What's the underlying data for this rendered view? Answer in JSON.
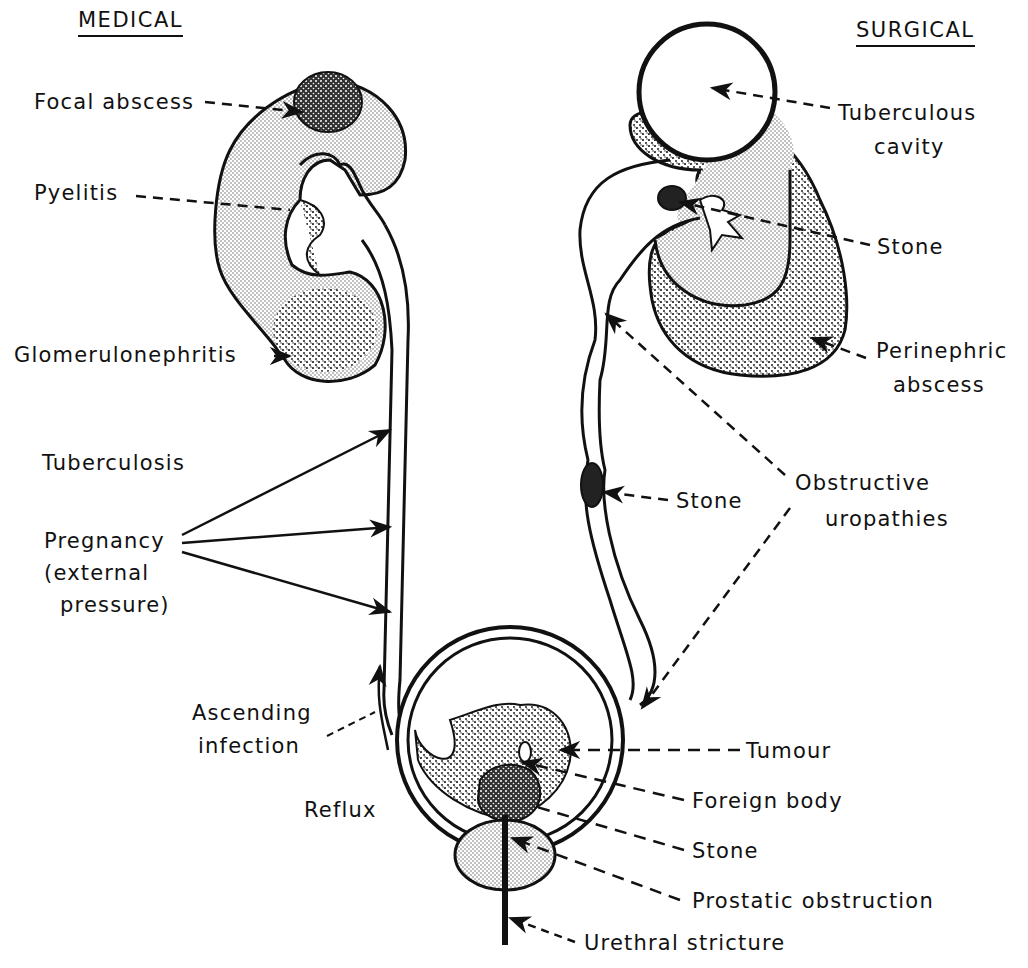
{
  "headers": {
    "left": "MEDICAL",
    "right": "SURGICAL"
  },
  "medical_labels": {
    "focal_abscess": "Focal abscess",
    "pyelitis": "Pyelitis",
    "glomerulonephritis": "Glomerulonephritis",
    "tuberculosis": "Tuberculosis",
    "pregnancy_line1": "Pregnancy",
    "pregnancy_line2": "(external",
    "pregnancy_line3": "pressure)",
    "ascending_line1": "Ascending",
    "ascending_line2": "infection",
    "reflux": "Reflux"
  },
  "surgical_labels": {
    "tuberculous_line1": "Tuberculous",
    "tuberculous_line2": "cavity",
    "stone_kidney": "Stone",
    "perinephric_line1": "Perinephric",
    "perinephric_line2": "abscess",
    "stone_ureter": "Stone",
    "obstructive_line1": "Obstructive",
    "obstructive_line2": "uropathies"
  },
  "bladder_labels": {
    "tumour": "Tumour",
    "foreign_body": "Foreign body",
    "stone": "Stone",
    "prostatic": "Prostatic obstruction",
    "urethral": "Urethral stricture"
  }
}
